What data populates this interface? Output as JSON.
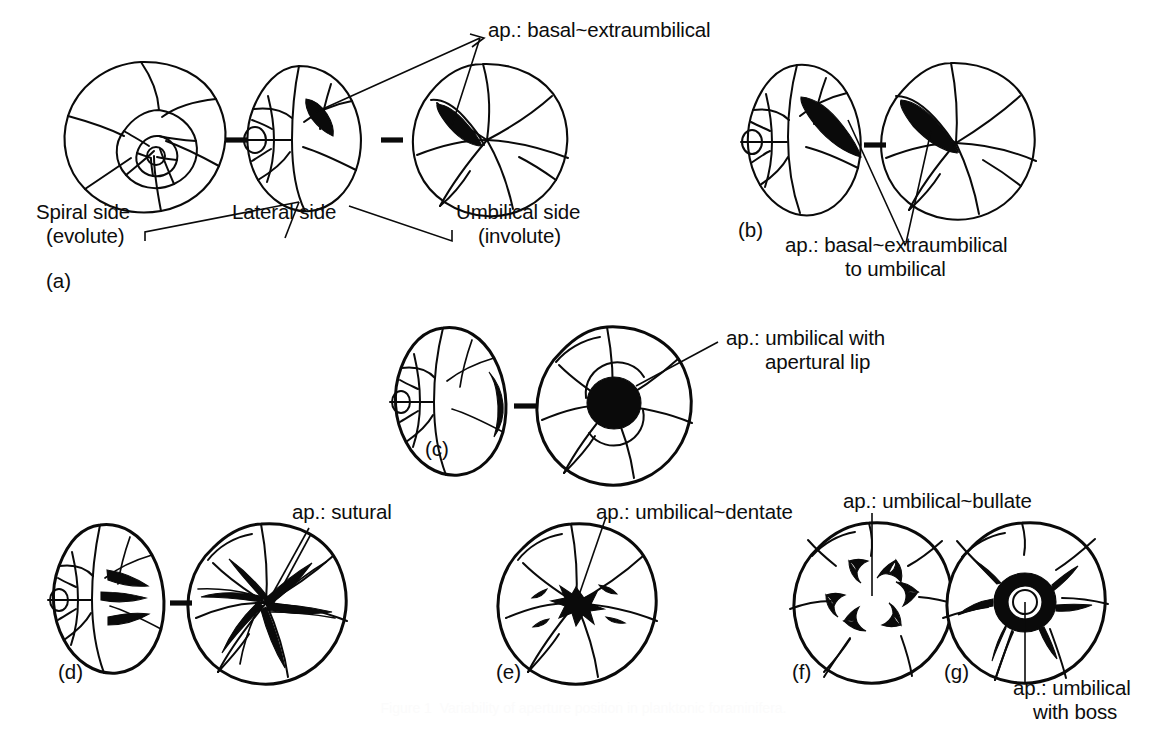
{
  "figure": {
    "caption": "Figure 1  Variability of aperture position in planktonic foraminifera.",
    "ink_color": "#0a0a0a",
    "background_color": "#ffffff"
  },
  "panels": [
    {
      "id": "(a)",
      "views": [
        "spiral side",
        "lateral side",
        "umbilical side"
      ],
      "aperture_label": "ap.: basal~extraumbilical",
      "view_labels": [
        {
          "line1": "Spiral side",
          "line2": "(evolute)"
        },
        {
          "line1": "Lateral side",
          "line2": ""
        },
        {
          "line1": "Umbilical side",
          "line2": "(involute)"
        }
      ]
    },
    {
      "id": "(b)",
      "views": [
        "lateral side",
        "umbilical side"
      ],
      "aperture_label_line1": "ap.: basal~extraumbilical",
      "aperture_label_line2": "to umbilical"
    },
    {
      "id": "(c)",
      "views": [
        "lateral side",
        "umbilical side"
      ],
      "aperture_label_line1": "ap.: umbilical with",
      "aperture_label_line2": "apertural lip"
    },
    {
      "id": "(d)",
      "views": [
        "lateral side",
        "umbilical side"
      ],
      "aperture_label": "ap.: sutural"
    },
    {
      "id": "(e)",
      "views": [
        "umbilical side"
      ],
      "aperture_label": "ap.: umbilical~dentate"
    },
    {
      "id": "(f)",
      "views": [
        "umbilical side"
      ],
      "aperture_label": "ap.: umbilical~bullate"
    },
    {
      "id": "(g)",
      "views": [
        "umbilical side"
      ],
      "aperture_label_line1": "ap.: umbilical",
      "aperture_label_line2": "with boss"
    }
  ],
  "labels": {
    "a_aperture": "ap.: basal~extraumbilical",
    "a_spiral_1": "Spiral side",
    "a_spiral_2": "(evolute)",
    "a_lateral_1": "Lateral side",
    "a_umbilical_1": "Umbilical side",
    "a_umbilical_2": "(involute)",
    "a_id": "(a)",
    "b_aperture_1": "ap.: basal~extraumbilical",
    "b_aperture_2": "to umbilical",
    "b_id": "(b)",
    "c_aperture_1": "ap.: umbilical with",
    "c_aperture_2": "apertural lip",
    "c_id": "(c)",
    "d_aperture": "ap.: sutural",
    "d_id": "(d)",
    "e_aperture": "ap.: umbilical~dentate",
    "e_id": "(e)",
    "f_aperture": "ap.: umbilical~bullate",
    "f_id": "(f)",
    "g_aperture_1": "ap.: umbilical",
    "g_aperture_2": "with boss",
    "g_id": "(g)"
  }
}
